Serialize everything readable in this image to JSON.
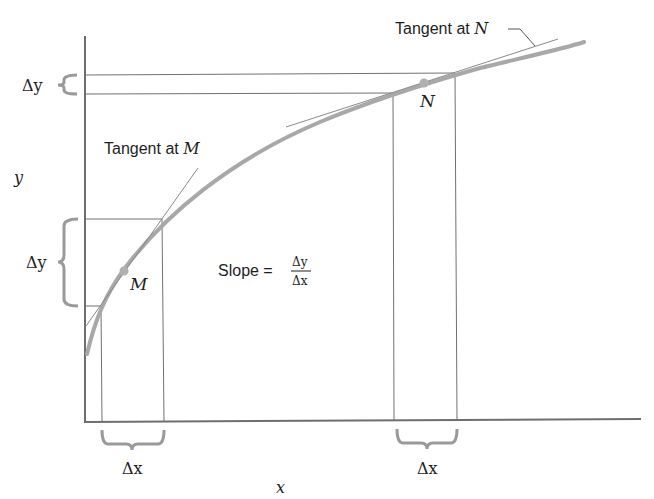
{
  "figure": {
    "colors": {
      "axis": "#6e6e6e",
      "curve": "#a8a8a8",
      "guide_lines": "#707070",
      "tangent": "#8a8a8a",
      "point": "#b0b0b0",
      "brace": "#9a9a9a",
      "text": "#1e1e1e"
    },
    "axes": {
      "x_label": "x",
      "y_label": "y"
    },
    "labels": {
      "tangent_m": "Tangent at ",
      "tangent_m_var": "M",
      "tangent_n": "Tangent at ",
      "tangent_n_var": "N",
      "point_m": "M",
      "point_n": "N",
      "slope_text": "Slope =",
      "slope_numerator": "Δy",
      "slope_denominator": "Δx",
      "delta_y_top": "Δy",
      "delta_y_left": "Δy",
      "delta_x_left": "Δx",
      "delta_x_right": "Δx"
    }
  }
}
